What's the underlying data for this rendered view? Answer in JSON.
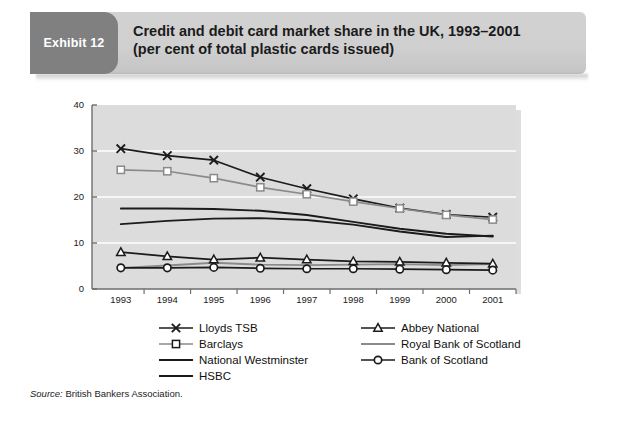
{
  "banner": {
    "badge_label": "Exhibit 12",
    "title_line1": "Credit and debit card market share in the UK, 1993–2001",
    "title_line2": "(per cent of total plastic cards issued)",
    "badge_color": "#808080",
    "banner_color": "#cfcfcf"
  },
  "source": {
    "prefix": "Source:",
    "text": "British Bankers Association."
  },
  "legend": {
    "left": [
      {
        "label": "Lloyds TSB",
        "key": "x-marker-line"
      },
      {
        "label": "Barclays",
        "key": "square-marker-line"
      },
      {
        "label": "National Westminster",
        "key": "plain-line"
      },
      {
        "label": "HSBC",
        "key": "plain-line"
      }
    ],
    "right": [
      {
        "label": "Abbey National",
        "key": "triangle-marker-line"
      },
      {
        "label": "Royal Bank of Scotland",
        "key": "gray-plain-line"
      },
      {
        "label": "Bank of Scotland",
        "key": "circle-marker-line"
      }
    ]
  },
  "chart_data": {
    "type": "line",
    "title": "Credit and debit card market share in the UK, 1993–2001",
    "subtitle": "(per cent of total plastic cards issued)",
    "xlabel": "",
    "ylabel": "",
    "x": [
      1993,
      1994,
      1995,
      1996,
      1997,
      1998,
      1999,
      2000,
      2001
    ],
    "categories": [
      "1993",
      "1994",
      "1995",
      "1996",
      "1997",
      "1998",
      "1999",
      "2000",
      "2001"
    ],
    "ylim": [
      0,
      40
    ],
    "yticks": [
      0,
      10,
      20,
      30,
      40
    ],
    "grid": "horizontal-white",
    "legend_position": "below",
    "plot_background": "#dcdcdc",
    "series": [
      {
        "name": "Lloyds TSB",
        "marker": "x",
        "color": "#1b1b1b",
        "values": [
          30.5,
          29.0,
          28.0,
          24.3,
          21.8,
          19.6,
          17.6,
          16.2,
          15.6
        ]
      },
      {
        "name": "Barclays",
        "marker": "square",
        "color": "#8a8a8a",
        "values": [
          25.9,
          25.6,
          24.1,
          22.1,
          20.6,
          19.0,
          17.5,
          16.1,
          15.1
        ]
      },
      {
        "name": "National Westminster",
        "marker": "none",
        "color": "#1b1b1b",
        "values": [
          17.5,
          17.5,
          17.4,
          17.0,
          16.1,
          14.6,
          13.1,
          12.0,
          11.4
        ]
      },
      {
        "name": "HSBC",
        "marker": "none",
        "color": "#1b1b1b",
        "values": [
          14.1,
          14.8,
          15.3,
          15.4,
          15.0,
          14.0,
          12.5,
          11.3,
          11.6
        ]
      },
      {
        "name": "Abbey National",
        "marker": "triangle",
        "color": "#1b1b1b",
        "values": [
          8.0,
          7.1,
          6.4,
          6.8,
          6.4,
          6.0,
          5.9,
          5.7,
          5.5
        ]
      },
      {
        "name": "Royal Bank of Scotland",
        "marker": "none",
        "color": "#8a8a8a",
        "values": [
          4.6,
          5.1,
          5.7,
          5.3,
          5.2,
          5.3,
          5.4,
          5.2,
          5.4
        ]
      },
      {
        "name": "Bank of Scotland",
        "marker": "circle",
        "color": "#1b1b1b",
        "values": [
          4.6,
          4.6,
          4.7,
          4.5,
          4.4,
          4.4,
          4.3,
          4.2,
          4.1
        ]
      }
    ]
  }
}
